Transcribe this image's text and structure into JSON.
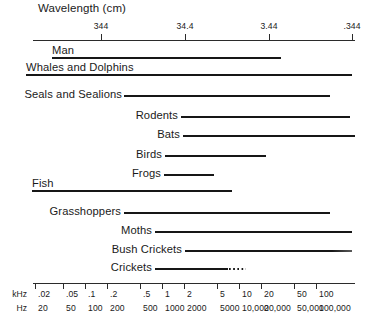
{
  "figure": {
    "title": "Wavelength (cm)"
  },
  "top_axis": {
    "label": "Wavelength (cm)",
    "ticks": [
      {
        "label": "344",
        "x": 101
      },
      {
        "label": "34.4",
        "x": 185
      },
      {
        "label": "3.44",
        "x": 269
      },
      {
        "label": ".344",
        "x": 352
      }
    ],
    "line": {
      "x": 33,
      "width": 322,
      "y": 40
    }
  },
  "bottom_axis": {
    "unit_rows": [
      {
        "name": "khz-unit-label",
        "label": "kHz"
      },
      {
        "name": "hz-unit-label",
        "label": "Hz"
      }
    ],
    "line": {
      "x": 33,
      "width": 322,
      "y": 283
    },
    "ticks": [
      {
        "khz": ".02",
        "hz": "20",
        "x": 35
      },
      {
        "khz": ".05",
        "hz": "50",
        "x": 63
      },
      {
        "khz": ".1",
        "hz": "100",
        "x": 85
      },
      {
        "khz": ".2",
        "hz": "200",
        "x": 107
      },
      {
        "khz": ".5",
        "hz": "500",
        "x": 140
      },
      {
        "khz": "1",
        "hz": "1000",
        "x": 162
      },
      {
        "khz": "2",
        "hz": "2000",
        "x": 184
      },
      {
        "khz": "5",
        "hz": "5000",
        "x": 217
      },
      {
        "khz": "10",
        "hz": "10,000",
        "x": 239
      },
      {
        "khz": "20",
        "hz": "20,000",
        "x": 261
      },
      {
        "khz": "50",
        "hz": "50,000",
        "x": 294
      },
      {
        "khz": "100",
        "hz": "100,000",
        "x": 316
      }
    ]
  },
  "chart_data": {
    "type": "bar",
    "title": "Wavelength (cm)",
    "xlabel": "Frequency",
    "ylabel": "",
    "orientation": "horizontal",
    "scale": "log",
    "x_axis_top": {
      "name": "Wavelength (cm)",
      "tick_labels": [
        "344",
        "34.4",
        "3.44",
        ".344"
      ]
    },
    "x_axis_bottom": {
      "names": [
        "kHz",
        "Hz"
      ],
      "khz_tick_labels": [
        ".02",
        ".05",
        ".1",
        ".2",
        ".5",
        "1",
        "2",
        "5",
        "10",
        "20",
        "50",
        "100"
      ],
      "hz_tick_labels": [
        "20",
        "50",
        "100",
        "200",
        "500",
        "1000",
        "2000",
        "5000",
        "10,000",
        "20,000",
        "50,000",
        "100,000"
      ]
    },
    "categories": [
      "Man",
      "Whales and Dolphins",
      "Seals and Sealions",
      "Rodents",
      "Bats",
      "Birds",
      "Frogs",
      "Fish",
      "Grasshoppers",
      "Moths",
      "Bush Crickets",
      "Crickets"
    ],
    "ranges_hz": [
      {
        "category": "Man",
        "from": 20,
        "to": 20000
      },
      {
        "category": "Whales and Dolphins",
        "from": 20,
        "to": 150000
      },
      {
        "category": "Seals and Sealions",
        "from": 200,
        "to": 80000
      },
      {
        "category": "Rodents",
        "from": 1000,
        "to": 100000
      },
      {
        "category": "Bats",
        "from": 1000,
        "to": 150000
      },
      {
        "category": "Birds",
        "from": 500,
        "to": 20000
      },
      {
        "category": "Frogs",
        "from": 500,
        "to": 4000
      },
      {
        "category": "Fish",
        "from": 20,
        "to": 8000
      },
      {
        "category": "Grasshoppers",
        "from": 200,
        "to": 80000
      },
      {
        "category": "Moths",
        "from": 800,
        "to": 150000
      },
      {
        "category": "Bush Crickets",
        "from": 2000,
        "to": 150000
      },
      {
        "category": "Crickets",
        "from": 800,
        "to": 20000,
        "dashed_extension_to": 40000
      }
    ],
    "grid": false,
    "legend": null
  },
  "rows": [
    {
      "name": "row-man",
      "label": "Man",
      "label_style": "underlined",
      "label_x": 52,
      "label_y": 44,
      "bar": {
        "x": 52,
        "width": 229,
        "y": 57
      },
      "dots": null
    },
    {
      "name": "row-whales-and-dolphins",
      "label": "Whales and Dolphins",
      "label_style": "underlined",
      "label_x": 26,
      "label_y": 61,
      "bar": {
        "x": 26,
        "width": 326,
        "y": 74
      },
      "dots": null
    },
    {
      "name": "row-seals-and-sealions",
      "label": "Seals and Sealions",
      "label_style": "inline",
      "label_x": 122,
      "label_y": 88,
      "bar": {
        "x": 124,
        "width": 206,
        "y": 95
      },
      "dots": null
    },
    {
      "name": "row-rodents",
      "label": "Rodents",
      "label_style": "inline",
      "label_x": 178,
      "label_y": 109,
      "bar": {
        "x": 181,
        "width": 169,
        "y": 116
      },
      "dots": null
    },
    {
      "name": "row-bats",
      "label": "Bats",
      "label_style": "inline",
      "label_x": 180,
      "label_y": 128,
      "bar": {
        "x": 183,
        "width": 172,
        "y": 135
      },
      "dots": null
    },
    {
      "name": "row-birds",
      "label": "Birds",
      "label_style": "inline",
      "label_x": 162,
      "label_y": 148,
      "bar": {
        "x": 165,
        "width": 101,
        "y": 155
      },
      "dots": null
    },
    {
      "name": "row-frogs",
      "label": "Frogs",
      "label_style": "inline",
      "label_x": 161,
      "label_y": 167,
      "bar": {
        "x": 164,
        "width": 50,
        "y": 174
      },
      "dots": null
    },
    {
      "name": "row-fish",
      "label": "Fish",
      "label_style": "underlined",
      "label_x": 32,
      "label_y": 177,
      "bar": {
        "x": 32,
        "width": 200,
        "y": 190
      },
      "dots": null
    },
    {
      "name": "row-grasshoppers",
      "label": "Grasshoppers",
      "label_style": "inline",
      "label_x": 121,
      "label_y": 205,
      "bar": {
        "x": 124,
        "width": 206,
        "y": 212
      },
      "dots": null
    },
    {
      "name": "row-moths",
      "label": "Moths",
      "label_style": "inline",
      "label_x": 152,
      "label_y": 224,
      "bar": {
        "x": 155,
        "width": 197,
        "y": 231
      },
      "dots": null
    },
    {
      "name": "row-bush-crickets",
      "label": "Bush Crickets",
      "label_style": "inline-thin-end",
      "label_x": 182,
      "label_y": 243,
      "bar": {
        "x": 185,
        "width": 167,
        "y": 250
      },
      "dots": null
    },
    {
      "name": "row-crickets",
      "label": "Crickets",
      "label_style": "inline",
      "label_x": 152,
      "label_y": 261,
      "bar": {
        "x": 155,
        "width": 73,
        "y": 268
      },
      "dots": {
        "x": 229,
        "width": 17,
        "y": 268
      }
    }
  ]
}
